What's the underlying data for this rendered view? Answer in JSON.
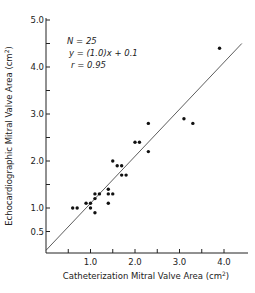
{
  "chart_data": {
    "type": "scatter",
    "title": "",
    "xlabel": "Catheterization Mitral Valve Area (cm²)",
    "ylabel": "Echocardiographic Mitral Valve Area (cm²)",
    "xlim": [
      0,
      4.6
    ],
    "ylim": [
      0,
      5.0
    ],
    "x_ticks": [
      0.5,
      1.0,
      1.5,
      2.0,
      2.5,
      3.0,
      3.5,
      4.0
    ],
    "x_tick_labels": [
      "",
      "1.0",
      "",
      "2.0",
      "",
      "3.0",
      "",
      "4.0"
    ],
    "y_ticks": [
      0.5,
      1.0,
      1.5,
      2.0,
      2.5,
      3.0,
      3.5,
      4.0,
      4.5,
      5.0
    ],
    "y_tick_labels": [
      "0.5",
      "1.0",
      "",
      "2.0",
      "",
      "3.0",
      "",
      "4.0",
      "",
      "5.0"
    ],
    "grid": false,
    "legend": null,
    "annotations": [
      "N = 25",
      "y = (1.0)x + 0.1",
      "r = 0.95"
    ],
    "regression": {
      "slope": 1.0,
      "intercept": 0.1,
      "x_range": [
        0,
        4.4
      ]
    },
    "series": [
      {
        "name": "patients",
        "points": [
          [
            0.6,
            1.0
          ],
          [
            0.7,
            1.0
          ],
          [
            0.9,
            1.1
          ],
          [
            1.0,
            1.1
          ],
          [
            1.0,
            1.0
          ],
          [
            1.1,
            0.9
          ],
          [
            1.1,
            1.2
          ],
          [
            1.1,
            1.3
          ],
          [
            1.2,
            1.3
          ],
          [
            1.4,
            1.4
          ],
          [
            1.4,
            1.3
          ],
          [
            1.5,
            1.3
          ],
          [
            1.4,
            1.1
          ],
          [
            1.5,
            2.0
          ],
          [
            1.6,
            1.9
          ],
          [
            1.7,
            1.9
          ],
          [
            1.7,
            1.7
          ],
          [
            1.8,
            1.7
          ],
          [
            2.0,
            2.4
          ],
          [
            2.1,
            2.4
          ],
          [
            2.3,
            2.8
          ],
          [
            2.3,
            2.2
          ],
          [
            3.1,
            2.9
          ],
          [
            3.3,
            2.8
          ],
          [
            3.9,
            4.4
          ]
        ]
      }
    ]
  },
  "labels": {
    "xlabel_main": "Catheterization Mitral Valve Area (cm",
    "xlabel_sup": "2",
    "xlabel_end": ")",
    "ylabel_main": "Echocardiographic Mitral Valve Area (cm",
    "ylabel_sup": "2",
    "ylabel_end": ")",
    "annot_n": "N = 25",
    "annot_eq": "y = (1.0)x + 0.1",
    "annot_r": "r = 0.95"
  }
}
